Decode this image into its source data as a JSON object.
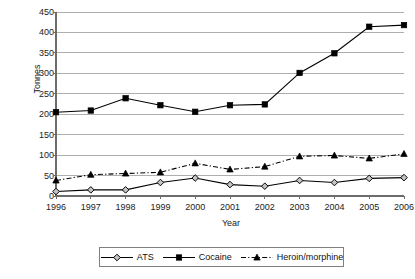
{
  "chart_data": {
    "type": "line",
    "title": "",
    "xlabel": "Year",
    "ylabel": "Tonnes",
    "categories": [
      "1996",
      "1997",
      "1998",
      "1999",
      "2000",
      "2001",
      "2002",
      "2003",
      "2004",
      "2005",
      "2006"
    ],
    "x": [
      1996,
      1997,
      1998,
      1999,
      2000,
      2001,
      2002,
      2003,
      2004,
      2005,
      2006
    ],
    "ylim": [
      0,
      450
    ],
    "yticks": [
      0,
      50,
      100,
      150,
      200,
      250,
      300,
      350,
      400,
      450
    ],
    "ytick_labels": [
      "0",
      "50",
      "100",
      "150",
      "200",
      "250",
      "300",
      "350",
      "400",
      "450"
    ],
    "grid": true,
    "grid_axis": "y",
    "legend_position": "bottom",
    "series": [
      {
        "name": "ATS",
        "marker": "diamond",
        "line_style": "solid",
        "color": "#000000",
        "values": [
          11,
          15,
          15,
          33,
          44,
          28,
          24,
          38,
          33,
          43,
          45
        ]
      },
      {
        "name": "Cocaine",
        "marker": "square",
        "line_style": "solid",
        "color": "#000000",
        "values": [
          205,
          209,
          239,
          222,
          206,
          222,
          224,
          301,
          349,
          414,
          418
        ]
      },
      {
        "name": "Heroin/morphine",
        "marker": "triangle",
        "line_style": "dashdot",
        "color": "#000000",
        "values": [
          38,
          52,
          55,
          58,
          80,
          65,
          72,
          97,
          99,
          92,
          103
        ]
      }
    ]
  },
  "legend": {
    "items": [
      {
        "label": "ATS"
      },
      {
        "label": "Cocaine"
      },
      {
        "label": "Heroin/morphine"
      }
    ]
  },
  "colors": {
    "ink": "#000000",
    "grid": "#9a9a9a",
    "axis": "#6b6b6b",
    "legend_border": "#808080",
    "background": "#ffffff"
  }
}
